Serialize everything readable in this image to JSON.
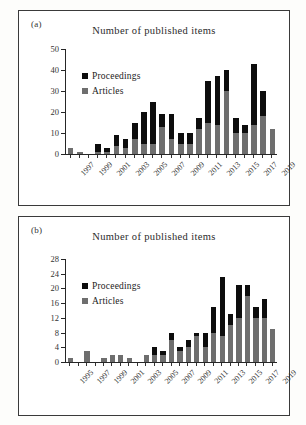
{
  "figure": {
    "background": "#fdfdfb",
    "panels": [
      "a",
      "b"
    ]
  },
  "panel_a": {
    "label": "(a)",
    "title": "Number of published items",
    "legend": {
      "proceedings_label": "Proceedings",
      "articles_label": "Articles",
      "proceedings_color": "#0d0d0d",
      "articles_color": "#6e6e6e"
    }
  },
  "panel_b": {
    "label": "(b)",
    "title": "Number of published items",
    "legend": {
      "proceedings_label": "Proceedings",
      "articles_label": "Articles",
      "proceedings_color": "#0d0d0d",
      "articles_color": "#6e6e6e"
    }
  },
  "chart_data": [
    {
      "id": "panel-a",
      "type": "bar",
      "stacked": true,
      "title": "Number of published items",
      "panel_label": "(a)",
      "xlabel": "",
      "ylabel": "",
      "ylim": [
        0,
        50
      ],
      "yticks": [
        0,
        10,
        20,
        30,
        40,
        50
      ],
      "ytick_labels": [
        "0",
        "10",
        "20",
        "30",
        "40",
        "50"
      ],
      "grid": false,
      "legend_position": "upper-left",
      "categories": [
        1997,
        1998,
        1999,
        2000,
        2001,
        2002,
        2003,
        2004,
        2005,
        2006,
        2007,
        2008,
        2009,
        2010,
        2011,
        2012,
        2013,
        2014,
        2015,
        2016,
        2017,
        2018,
        2019
      ],
      "xtick_labels": [
        "1997",
        "1999",
        "2001",
        "2003",
        "2005",
        "2007",
        "2009",
        "2011",
        "2013",
        "2015",
        "2017",
        "2019"
      ],
      "series": [
        {
          "name": "Articles",
          "color": "#6e6e6e",
          "values": [
            3,
            1,
            0,
            1,
            1,
            4,
            3,
            7,
            5,
            5,
            13,
            7,
            5,
            5,
            12,
            15,
            14,
            30,
            10,
            10,
            14,
            18,
            12
          ]
        },
        {
          "name": "Proceedings",
          "color": "#0d0d0d",
          "values": [
            0,
            0,
            0,
            4,
            2,
            5,
            4,
            8,
            15,
            20,
            6,
            12,
            5,
            5,
            5,
            20,
            23,
            10,
            7,
            4,
            29,
            12,
            0
          ]
        }
      ],
      "totals": [
        3,
        1,
        0,
        5,
        3,
        9,
        7,
        15,
        20,
        25,
        19,
        19,
        10,
        10,
        17,
        35,
        37,
        40,
        17,
        14,
        43,
        30,
        12
      ]
    },
    {
      "id": "panel-b",
      "type": "bar",
      "stacked": true,
      "title": "Number of published items",
      "panel_label": "(b)",
      "xlabel": "",
      "ylabel": "",
      "ylim": [
        0,
        28
      ],
      "yticks": [
        0,
        4,
        8,
        12,
        16,
        20,
        24,
        28
      ],
      "ytick_labels": [
        "0",
        "4",
        "8",
        "12",
        "16",
        "20",
        "24",
        "28"
      ],
      "grid": false,
      "legend_position": "upper-left",
      "categories": [
        1995,
        1996,
        1997,
        1998,
        1999,
        2000,
        2001,
        2002,
        2003,
        2004,
        2005,
        2006,
        2007,
        2008,
        2009,
        2010,
        2011,
        2012,
        2013,
        2014,
        2015,
        2016,
        2017,
        2018,
        2019
      ],
      "xtick_labels": [
        "1995",
        "1997",
        "1999",
        "2001",
        "2003",
        "2005",
        "2007",
        "2009",
        "2011",
        "2013",
        "2015",
        "2017",
        "2019"
      ],
      "series": [
        {
          "name": "Articles",
          "color": "#6e6e6e",
          "values": [
            1,
            0,
            3,
            0,
            1,
            2,
            2,
            1,
            0,
            2,
            2,
            2,
            6,
            3,
            4,
            7,
            4,
            8,
            7,
            10,
            12,
            18,
            12,
            12,
            9
          ]
        },
        {
          "name": "Proceedings",
          "color": "#0d0d0d",
          "values": [
            0,
            0,
            0,
            0,
            0,
            0,
            0,
            0,
            0,
            0,
            2,
            1,
            2,
            1,
            2,
            1,
            4,
            7,
            16,
            3,
            9,
            3,
            3,
            5,
            0
          ]
        }
      ],
      "totals": [
        1,
        0,
        3,
        0,
        1,
        2,
        2,
        1,
        0,
        2,
        4,
        3,
        8,
        4,
        6,
        8,
        8,
        15,
        23,
        13,
        21,
        21,
        15,
        17,
        9
      ]
    }
  ]
}
